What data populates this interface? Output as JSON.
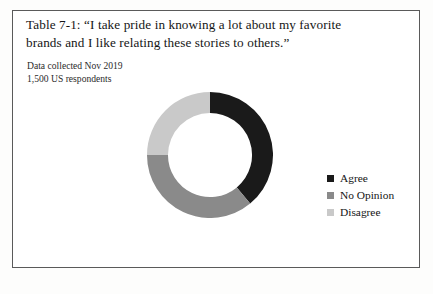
{
  "figure": {
    "title_line_1": "Table 7-1: “I take pride in knowing a lot about my favorite",
    "title_line_2": "brands and I like relating these stories to others.”",
    "note_line_1": "Data collected Nov 2019",
    "note_line_2": "1,500 US respondents"
  },
  "legend": {
    "items": [
      {
        "label": "Agree",
        "color": "#1a1a1a"
      },
      {
        "label": "No Opinion",
        "color": "#8a8a8a"
      },
      {
        "label": "Disagree",
        "color": "#c9c9c9"
      }
    ]
  },
  "chart_data": {
    "type": "pie",
    "variant": "donut",
    "title": "Table 7-1: “I take pride in knowing a lot about my favorite brands and I like relating these stories to others.”",
    "subtitle": "Data collected Nov 2019 / 1,500 US respondents",
    "categories": [
      "Agree",
      "No Opinion",
      "Disagree"
    ],
    "values": [
      39,
      36,
      25
    ],
    "value_unit": "percent",
    "colors": [
      "#1a1a1a",
      "#8a8a8a",
      "#c9c9c9"
    ],
    "start_angle_deg": 0,
    "direction": "clockwise",
    "inner_radius_ratio": 0.667,
    "legend_position": "right",
    "data_labels": false,
    "grid": false
  }
}
